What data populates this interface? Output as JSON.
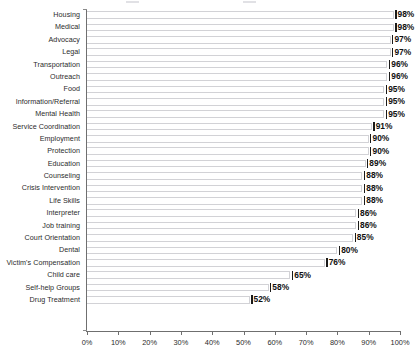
{
  "chart_data": {
    "type": "bar",
    "orientation": "horizontal",
    "title": "",
    "subtitle": "",
    "xlabel": "",
    "ylabel": "",
    "xlim": [
      0,
      100
    ],
    "grid": false,
    "legend": null,
    "value_suffix": "%",
    "tick_labels": [
      "0%",
      "10%",
      "20%",
      "30%",
      "40%",
      "50%",
      "60%",
      "70%",
      "80%",
      "90%",
      "100%"
    ],
    "tick_values": [
      0,
      10,
      20,
      30,
      40,
      50,
      60,
      70,
      80,
      90,
      100
    ],
    "categories": [
      "Housing",
      "Medical",
      "Advocacy",
      "Legal",
      "Transportation",
      "Outreach",
      "Food",
      "Information/Referral",
      "Mental Health",
      "Service Coordination",
      "Employment",
      "Protection",
      "Education",
      "Counseling",
      "Crisis Intervention",
      "Life Skills",
      "Interpreter",
      "Job training",
      "Court Orientation",
      "Dental",
      "Victim's Compensation",
      "Child care",
      "Self-help Groups",
      "Drug Treatment"
    ],
    "values": [
      98,
      98,
      97,
      97,
      96,
      96,
      95,
      95,
      95,
      91,
      90,
      90,
      89,
      88,
      88,
      88,
      86,
      86,
      85,
      80,
      76,
      65,
      58,
      52
    ],
    "data_labels": [
      "98%",
      "98%",
      "97%",
      "97%",
      "96%",
      "96%",
      "95%",
      "95%",
      "95%",
      "91%",
      "90%",
      "90%",
      "89%",
      "88%",
      "88%",
      "88%",
      "86%",
      "86%",
      "85%",
      "80%",
      "76%",
      "65%",
      "58%",
      "52%"
    ],
    "colors": {
      "bar_fill": "#ffffff",
      "bar_border": "#d2d2d6",
      "axis": "#6f6f6f",
      "value_label": "#101010",
      "category_label": "#2b2b2b",
      "background": "#ffffff"
    }
  }
}
